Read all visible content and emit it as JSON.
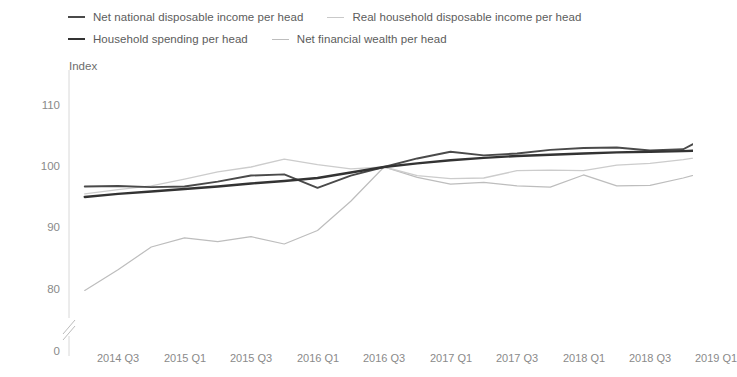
{
  "legend": {
    "rows": [
      [
        {
          "label": "Net national disposable income per head",
          "color": "#4a4a4a",
          "width": 2.2
        },
        {
          "label": "Real household disposable income per head",
          "color": "#c9c9c9",
          "width": 1.4
        }
      ],
      [
        {
          "label": "Household spending per head",
          "color": "#333333",
          "width": 2.6
        },
        {
          "label": "Net financial wealth per head",
          "color": "#bdbdbd",
          "width": 1.2
        }
      ]
    ]
  },
  "axes": {
    "y_title": "Index",
    "y_ticks": [
      "110",
      "100",
      "90",
      "80",
      "0"
    ],
    "y_break": true,
    "x_ticks": [
      "2014 Q3",
      "2015 Q1",
      "2015 Q3",
      "2016 Q1",
      "2016 Q3",
      "2017 Q1",
      "2017 Q3",
      "2018 Q1",
      "2018 Q3",
      "2019 Q1"
    ]
  },
  "chart_data": {
    "type": "line",
    "title": "",
    "xlabel": "",
    "ylabel": "Index",
    "ylim": [
      78,
      113
    ],
    "grid": false,
    "legend_position": "top",
    "x": [
      "2014 Q2",
      "2014 Q3",
      "2014 Q4",
      "2015 Q1",
      "2015 Q2",
      "2015 Q3",
      "2015 Q4",
      "2016 Q1",
      "2016 Q2",
      "2016 Q3",
      "2016 Q4",
      "2017 Q1",
      "2017 Q2",
      "2017 Q3",
      "2017 Q4",
      "2018 Q1",
      "2018 Q2",
      "2018 Q3",
      "2018 Q4",
      "2019 Q1"
    ],
    "series": [
      {
        "name": "Net national disposable income per head",
        "color": "#4a4a4a",
        "width": 1.9,
        "values": [
          96.8,
          96.9,
          96.7,
          96.8,
          97.6,
          98.6,
          98.8,
          96.6,
          98.6,
          100.0,
          101.4,
          102.5,
          101.9,
          102.2,
          102.8,
          103.1,
          103.2,
          102.7,
          102.9,
          105.8
        ]
      },
      {
        "name": "Real household disposable income per head",
        "color": "#cccccc",
        "width": 1.3,
        "values": [
          95.6,
          96.3,
          96.9,
          98.0,
          99.2,
          100.0,
          101.3,
          100.4,
          99.7,
          100.0,
          98.6,
          98.1,
          98.2,
          99.4,
          99.5,
          99.4,
          100.3,
          100.6,
          101.2,
          102.1
        ]
      },
      {
        "name": "Household spending per head",
        "color": "#333333",
        "width": 2.4,
        "values": [
          95.1,
          95.6,
          96.0,
          96.4,
          96.8,
          97.3,
          97.7,
          98.2,
          99.1,
          100.0,
          100.6,
          101.1,
          101.5,
          101.8,
          102.0,
          102.2,
          102.4,
          102.5,
          102.6,
          102.8
        ]
      },
      {
        "name": "Net financial wealth per head",
        "color": "#bdbdbd",
        "width": 1.2,
        "values": [
          79.8,
          83.2,
          86.9,
          88.4,
          87.8,
          88.6,
          87.4,
          89.6,
          94.4,
          100.0,
          98.3,
          97.2,
          97.5,
          96.9,
          96.7,
          98.7,
          96.9,
          97.0,
          98.2,
          99.7
        ]
      }
    ]
  }
}
